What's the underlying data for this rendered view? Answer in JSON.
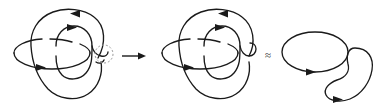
{
  "figure": {
    "kind": "knot-diagram-sequence",
    "background_color": "#ffffff",
    "stroke_color": "#1a1a1a",
    "highlight_color": "#9a9a9a",
    "panels": [
      {
        "id": "left",
        "name": "linked-two-component-link",
        "components": [
          "large-outer-loop",
          "inner-loop",
          "flat-ellipse"
        ],
        "crossing_highlighted": true
      },
      {
        "id": "middle",
        "name": "link-after-crossing-change",
        "components": [
          "large-outer-loop",
          "inner-loop",
          "flat-ellipse",
          "capped-strand"
        ],
        "crossing_highlighted": false
      },
      {
        "id": "right",
        "name": "unlinked-circle-and-kidney-curve",
        "components": [
          "round-circle",
          "kidney-curve"
        ],
        "crossing_highlighted": false
      }
    ],
    "operators": [
      {
        "id": "transform",
        "symbol": "→",
        "name": "rightwards-arrow"
      },
      {
        "id": "equivalence",
        "symbol": "≈",
        "name": "approximately-equal-sign"
      }
    ],
    "orientation_arrows": [
      {
        "panel": "left",
        "on": "outer-loop-top",
        "direction": "left"
      },
      {
        "panel": "left",
        "on": "inner-loop-top",
        "direction": "right"
      },
      {
        "panel": "left",
        "on": "flat-ellipse-bottom",
        "direction": "right"
      },
      {
        "panel": "middle",
        "on": "outer-loop-top",
        "direction": "left"
      },
      {
        "panel": "middle",
        "on": "inner-loop-top",
        "direction": "right"
      },
      {
        "panel": "middle",
        "on": "flat-ellipse-bottom",
        "direction": "right"
      },
      {
        "panel": "right",
        "on": "round-circle-bottom",
        "direction": "right"
      },
      {
        "panel": "right",
        "on": "kidney-curve-bottom",
        "direction": "right"
      }
    ]
  }
}
